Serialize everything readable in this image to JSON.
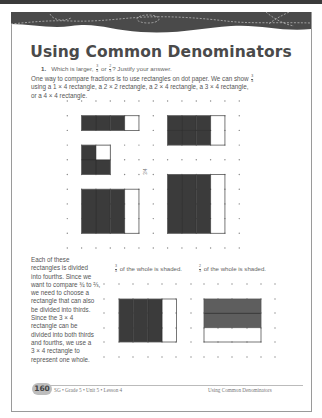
{
  "page": {
    "title": "Using Common Denominators",
    "question": {
      "number": "1.",
      "text_before": "Which is larger,",
      "fraction_a": {
        "num": "3",
        "den": "4"
      },
      "connector": "or",
      "fraction_b": {
        "num": "2",
        "den": "3"
      },
      "text_after": "? Justify your answer."
    },
    "intro": {
      "line1": "One way to compare fractions is to use rectangles on dot paper. We can show",
      "fraction": {
        "num": "3",
        "den": "4"
      },
      "line2": "using a 1 × 4 rectangle, a 2 × 2 rectangle, a 2 × 4 rectangle, a 3 × 4 rectangle,",
      "line3": "or a 4 × 4 rectangle."
    },
    "top_grid": {
      "center_label": "3/4",
      "rectangles": [
        {
          "name": "1x4",
          "rows": 1,
          "cols": 4,
          "shaded": "3 of 4 columns"
        },
        {
          "name": "2x2",
          "rows": 2,
          "cols": 2,
          "shaded": "3 of 4 squares"
        },
        {
          "name": "2x4",
          "rows": 2,
          "cols": 4,
          "shaded": "3 of 4 columns"
        },
        {
          "name": "3x4",
          "rows": 3,
          "cols": 4,
          "shaded": "3 of 4 columns"
        },
        {
          "name": "4x4",
          "rows": 4,
          "cols": 4,
          "shaded": "3 of 4 columns"
        }
      ]
    },
    "side_text": "Each of these rectangles is divided into fourths. Since we want to compare 3/4 to 2/3, we need to choose a rectangle that can also be divided into thirds. Since the 3 × 4 rectangle can be divided into both thirds and fourths, we use a 3 × 4 rectangle to represent one whole.",
    "side_lines": [
      "Each of these",
      "rectangles is divided",
      "into fourths. Since we",
      "want to compare ¾ to ⅔,",
      "we need to choose a",
      "rectangle that can also",
      "be divided into thirds.",
      "Since the 3 × 4",
      "rectangle can be",
      "divided into both thirds",
      "and fourths, we use a",
      "3 × 4 rectangle to",
      "represent one whole."
    ],
    "captions": {
      "left": {
        "fraction": {
          "num": "3",
          "den": "4"
        },
        "text": "of the whole is shaded."
      },
      "right": {
        "fraction": {
          "num": "2",
          "den": "3"
        },
        "text": "of the whole is shaded."
      }
    },
    "footer": {
      "page_number": "160",
      "left": "SG • Grade 5 • Unit 5 • Lesson 4",
      "right": "Using Common Denominators"
    }
  },
  "colors": {
    "shade_dark": "#3b3b3b",
    "shade_medium": "#5e5e5e",
    "banner": "#4a4a4a",
    "border": "#9a9a9a"
  }
}
